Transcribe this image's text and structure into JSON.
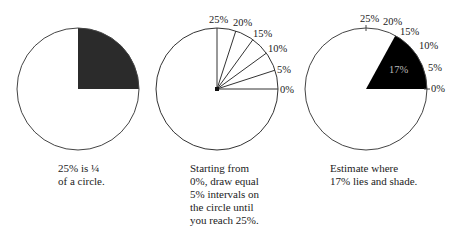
{
  "panels": [
    {
      "caption_lines": [
        "25% is ¼",
        "of a circle."
      ],
      "shaded_percent": 25,
      "shade_color": "#2b2b2b"
    },
    {
      "caption_lines": [
        "Starting from",
        "0%, draw equal",
        "5% intervals on",
        "the circle until",
        "you reach 25%."
      ],
      "labels": [
        "25%",
        "20%",
        "15%",
        "10%",
        "5%",
        "0%"
      ]
    },
    {
      "caption_lines": [
        "Estimate where",
        "17% lies and shade."
      ],
      "labels": [
        "25%",
        "20%",
        "15%",
        "10%",
        "5%",
        "0%"
      ],
      "shaded_percent": 17,
      "shaded_label": "17%",
      "shade_color": "#000000"
    }
  ]
}
